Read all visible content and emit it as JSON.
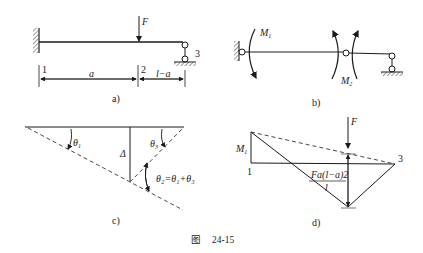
{
  "figure": {
    "caption_prefix": "图",
    "caption_number": "24-15"
  },
  "panel_a": {
    "caption": "a)",
    "force_label": "F",
    "node_labels": [
      "1",
      "2",
      "3"
    ],
    "dim_left": "a",
    "dim_right": "l−a"
  },
  "panel_b": {
    "caption": "b)",
    "moment1_label": "M",
    "moment1_sub": "1",
    "moment2_label": "M",
    "moment2_sub": "2"
  },
  "panel_c": {
    "caption": "c)",
    "theta1": "θ",
    "theta1_sub": "1",
    "theta3": "θ",
    "theta3_sub": "3",
    "delta": "Δ",
    "theta2_eq": "θ₂=θ₁+θ₃"
  },
  "panel_d": {
    "caption": "d)",
    "force_label": "F",
    "moment_label": "M",
    "moment_sub": "1",
    "node1": "1",
    "node3": "3",
    "fraction_num": "Fa(l−a)2",
    "fraction_den": "l"
  }
}
